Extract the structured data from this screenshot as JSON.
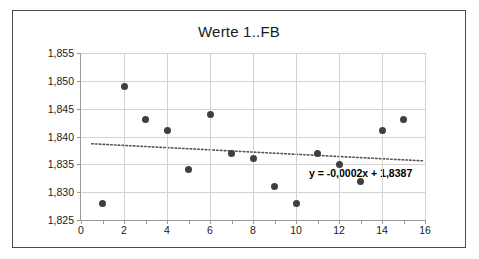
{
  "chart_data": {
    "type": "scatter",
    "title": "Werte 1..FB",
    "xlabel": "",
    "ylabel": "",
    "xlim": [
      0,
      16
    ],
    "ylim": [
      1.825,
      1.855
    ],
    "grid": true,
    "legend": false,
    "x_ticks": [
      "0",
      "2",
      "4",
      "6",
      "8",
      "10",
      "12",
      "14",
      "16"
    ],
    "x_tick_values": [
      0,
      2,
      4,
      6,
      8,
      10,
      12,
      14,
      16
    ],
    "y_ticks": [
      "1,825",
      "1,830",
      "1,835",
      "1,840",
      "1,845",
      "1,850",
      "1,855"
    ],
    "y_tick_values": [
      1.825,
      1.83,
      1.835,
      1.84,
      1.845,
      1.85,
      1.855
    ],
    "x": [
      1,
      2,
      3,
      4,
      5,
      6,
      7,
      8,
      9,
      10,
      11,
      12,
      13,
      14,
      15
    ],
    "values": [
      1.828,
      1.849,
      1.843,
      1.841,
      1.834,
      1.844,
      1.837,
      1.836,
      1.831,
      1.828,
      1.837,
      1.835,
      1.832,
      1.841,
      1.843
    ],
    "marker_color": "#3f3f3f",
    "trendline": {
      "equation_label": "y = -0,0002x + 1,8387",
      "slope": -0.0002,
      "intercept": 1.8387,
      "style": "dotted",
      "color": "#555555",
      "x_start": 0.5,
      "x_end": 16.0
    }
  },
  "frame": {
    "border_color": "#4d4d4d",
    "background": "#ffffff"
  }
}
